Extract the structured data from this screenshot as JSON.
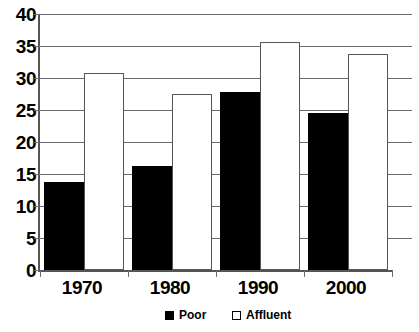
{
  "chart_data": {
    "type": "bar",
    "title": "",
    "subtitle": "",
    "xlabel": "",
    "ylabel": "",
    "categories": [
      "1970",
      "1980",
      "1990",
      "2000"
    ],
    "series": [
      {
        "name": "Poor",
        "color": "#000000",
        "style": "filled",
        "values": [
          13.7,
          16.2,
          27.8,
          24.6
        ]
      },
      {
        "name": "Affluent",
        "color": "#ffffff",
        "style": "hollow",
        "values": [
          30.8,
          27.5,
          35.6,
          33.7
        ]
      }
    ],
    "ylim": [
      0,
      40
    ],
    "ytick_step": 5,
    "yticks": [
      "0",
      "5",
      "10",
      "15",
      "20",
      "25",
      "30",
      "35",
      "40"
    ],
    "ytick_values": [
      0,
      5,
      10,
      15,
      20,
      25,
      30,
      35,
      40
    ],
    "grid": true,
    "grid_axis": "y",
    "legend_position": "bottom",
    "legend": [
      "Poor",
      "Affluent"
    ]
  }
}
